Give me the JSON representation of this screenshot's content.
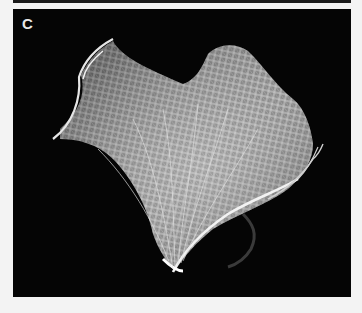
{
  "figure": {
    "panel_label": "C",
    "colors": {
      "page_background": "#f3f3f3",
      "panel_background": "#050505",
      "bone": "#d8d8d8",
      "label": "#e8e8e8"
    }
  }
}
